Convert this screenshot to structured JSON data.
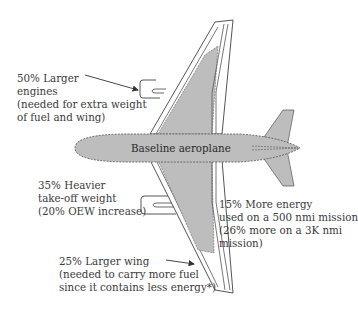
{
  "diagram": {
    "center_label": "Baseline aeroplane",
    "colors": {
      "fill": "#bdbdbd",
      "stroke": "#555555",
      "text": "#3a3a3a",
      "background": "#ffffff"
    },
    "annotations": [
      {
        "id": "engines",
        "lines": [
          "50% Larger",
          "engines",
          "(needed for extra weight",
          "of fuel and wing)"
        ]
      },
      {
        "id": "takeoff-weight",
        "lines": [
          "35% Heavier",
          "take-off weight",
          "(20% OEW increase)"
        ]
      },
      {
        "id": "wing",
        "lines": [
          "25% Larger wing",
          "(needed to carry more fuel",
          "since it contains less energy*)"
        ]
      },
      {
        "id": "energy",
        "lines": [
          "15% More energy",
          "used on a 500 nmi mission",
          "(26% more on a 3K nmi",
          "mission)"
        ]
      }
    ]
  }
}
